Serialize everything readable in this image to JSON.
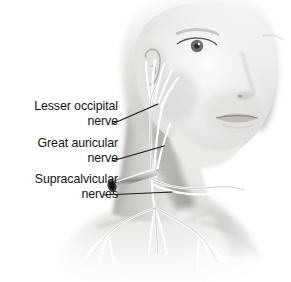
{
  "figure": {
    "background_color": "#ffffff",
    "text_color": "#141414",
    "width": 291,
    "height": 282
  },
  "labels": [
    {
      "name": "lesser-occipital-nerve",
      "line1": "Lesser occipital",
      "line2": "nerve"
    },
    {
      "name": "great-auricular-nerve",
      "line1": "Great auricular",
      "line2": "nerve"
    },
    {
      "name": "supraclavicular-nerves",
      "line1": "Supracalvicular",
      "line2": "nerves"
    }
  ],
  "illustration": {
    "subject": "head-and-neck-three-quarter-view",
    "style": "grayscale-medical-illustration",
    "skin_tone_light": "#f2f1ef",
    "skin_tone_mid": "#c9c7c4",
    "skin_tone_shadow": "#9b9996",
    "nerve_color": "#ffffff",
    "nerve_outline_color": "#7d7b78",
    "needle_color": "#d9d8d6",
    "needle_hub_color": "#2b2b2b",
    "leader_line_color": "#1a1a1a",
    "anatomy_parts": [
      "lesser-occipital-nerve",
      "great-auricular-nerve",
      "transverse-cervical-nerve",
      "supraclavicular-nerves",
      "sternocleidomastoid-muscle",
      "ear",
      "clavicle",
      "injection-needle"
    ]
  }
}
